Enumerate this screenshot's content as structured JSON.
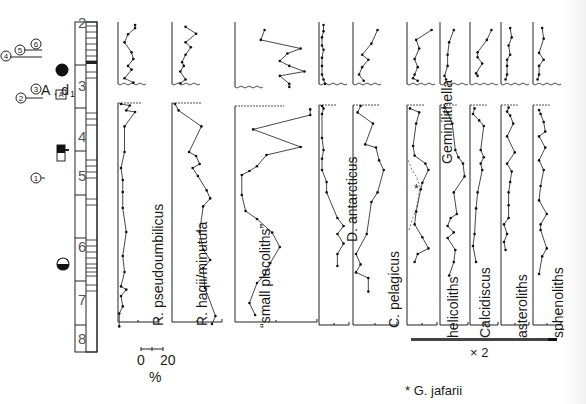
{
  "figure": {
    "scale_bar": {
      "left": "0",
      "right": "20",
      "unit": "%"
    },
    "magnification_bar": {
      "label": "× 2"
    },
    "footnote": "* G. jafarii"
  },
  "core_column": {
    "section_numbers": [
      "2",
      "3",
      "4",
      "5",
      "6",
      "7",
      "8"
    ],
    "left_markers": {
      "group_a": [
        "4",
        "5",
        "6"
      ],
      "group_b": [
        "2",
        "3"
      ],
      "circle_1": "1",
      "ad_label": "A . d",
      "ad_subscript": "1",
      "box_label": "A"
    }
  },
  "chart_data": {
    "type": "line",
    "title": "",
    "xlabel": "%",
    "ylabel": "Core section",
    "x_scale": "0–20 % per scale bar",
    "legend": [
      "* G. jafarii"
    ],
    "profiles": [
      {
        "name": "R. pseudoumbilicus",
        "upper": [
          [
            8,
            0
          ],
          [
            8,
            5
          ],
          [
            4,
            15
          ],
          [
            2,
            28
          ],
          [
            6,
            44
          ],
          [
            7,
            55
          ],
          [
            4,
            66
          ],
          [
            6,
            72
          ],
          [
            2,
            86
          ],
          [
            7,
            93
          ]
        ],
        "lower": [
          [
            0,
            0
          ],
          [
            5,
            2
          ],
          [
            3,
            8
          ],
          [
            8,
            10
          ],
          [
            2,
            28
          ],
          [
            2,
            60
          ],
          [
            0,
            80
          ],
          [
            1,
            95
          ],
          [
            1,
            110
          ],
          [
            1,
            130
          ],
          [
            3,
            160
          ],
          [
            1,
            190
          ],
          [
            2,
            210
          ],
          [
            0,
            228
          ],
          [
            3,
            232
          ],
          [
            0,
            240
          ],
          [
            1,
            253
          ],
          [
            -1,
            262
          ],
          [
            -1,
            278
          ]
        ]
      },
      {
        "name": "R. haqii/minutula",
        "upper": [
          [
            6,
            3
          ],
          [
            12,
            14
          ],
          [
            6,
            28
          ],
          [
            9,
            36
          ],
          [
            6,
            48
          ],
          [
            4,
            60
          ],
          [
            5,
            66
          ],
          [
            3,
            75
          ],
          [
            6,
            88
          ],
          [
            3,
            94
          ]
        ],
        "lower": [
          [
            0,
            0
          ],
          [
            2,
            8
          ],
          [
            15,
            28
          ],
          [
            8,
            60
          ],
          [
            12,
            65
          ],
          [
            14,
            75
          ],
          [
            10,
            80
          ],
          [
            13,
            90
          ],
          [
            18,
            108
          ],
          [
            20,
            118
          ],
          [
            16,
            128
          ],
          [
            14,
            160
          ],
          [
            16,
            182
          ],
          [
            20,
            195
          ],
          [
            16,
            205
          ],
          [
            17,
            230
          ],
          [
            23,
            265
          ],
          [
            21,
            275
          ]
        ]
      },
      {
        "name": "small placoliths",
        "upper": [
          [
            14,
            8
          ],
          [
            12,
            24
          ],
          [
            33,
            38
          ],
          [
            26,
            46
          ],
          [
            22,
            58
          ],
          [
            27,
            66
          ],
          [
            35,
            75
          ],
          [
            22,
            82
          ],
          [
            27,
            95
          ],
          [
            27,
            100
          ]
        ],
        "lower": [
          [
            38,
            3
          ],
          [
            38,
            10
          ],
          [
            8,
            28
          ],
          [
            33,
            50
          ],
          [
            15,
            60
          ],
          [
            10,
            74
          ],
          [
            6,
            80
          ],
          [
            2,
            85
          ],
          [
            2,
            110
          ],
          [
            4,
            130
          ],
          [
            10,
            140
          ],
          [
            18,
            157
          ],
          [
            22,
            175
          ],
          [
            17,
            195
          ],
          [
            14,
            210
          ],
          [
            10,
            220
          ],
          [
            6,
            245
          ],
          [
            9,
            260
          ]
        ]
      },
      {
        "name": "D. antarcticus",
        "upper": [
          [
            1,
            0
          ],
          [
            1,
            10
          ],
          [
            0,
            20
          ],
          [
            0,
            33
          ],
          [
            1,
            40
          ],
          [
            0,
            53
          ],
          [
            0,
            66
          ],
          [
            0,
            80
          ],
          [
            1,
            88
          ],
          [
            2,
            95
          ]
        ],
        "lower": [
          [
            0,
            0
          ],
          [
            1,
            3
          ],
          [
            0,
            10
          ],
          [
            0,
            40
          ],
          [
            1,
            55
          ],
          [
            0,
            66
          ],
          [
            0,
            80
          ],
          [
            3,
            95
          ],
          [
            3,
            108
          ],
          [
            10,
            140
          ],
          [
            14,
            150
          ],
          [
            10,
            160
          ],
          [
            14,
            172
          ],
          [
            10,
            185
          ],
          [
            10,
            200
          ]
        ]
      },
      {
        "name": "C. pelagicus",
        "upper": [
          [
            14,
            8
          ],
          [
            10,
            30
          ],
          [
            4,
            48
          ],
          [
            8,
            56
          ],
          [
            4,
            68
          ],
          [
            2,
            80
          ],
          [
            5,
            90
          ]
        ],
        "lower": [
          [
            3,
            0
          ],
          [
            1,
            8
          ],
          [
            11,
            22
          ],
          [
            6,
            48
          ],
          [
            13,
            52
          ],
          [
            15,
            68
          ],
          [
            18,
            80
          ],
          [
            14,
            108
          ],
          [
            10,
            120
          ],
          [
            7,
            160
          ],
          [
            0,
            185
          ],
          [
            3,
            198
          ],
          [
            0,
            208
          ],
          [
            8,
            215
          ],
          [
            8,
            232
          ]
        ]
      },
      {
        "name": "Geminilithella",
        "upper": [
          [
            14,
            8
          ],
          [
            4,
            24
          ],
          [
            6,
            38
          ],
          [
            3,
            55
          ],
          [
            5,
            68
          ],
          [
            3,
            80
          ],
          [
            2,
            86
          ],
          [
            5,
            90
          ]
        ],
        "lower": [
          [
            0,
            3
          ],
          [
            6,
            8
          ],
          [
            4,
            22
          ],
          [
            2,
            50
          ],
          [
            3,
            62
          ],
          [
            10,
            72
          ],
          [
            12,
            80
          ],
          [
            8,
            96
          ],
          [
            7,
            104
          ],
          [
            4,
            132
          ],
          [
            3,
            148
          ],
          [
            8,
            164
          ],
          [
            12,
            178
          ],
          [
            5,
            185
          ],
          [
            3,
            195
          ]
        ]
      },
      {
        "name": "helicoliths",
        "upper": [
          [
            7,
            8
          ],
          [
            4,
            28
          ],
          [
            3,
            48
          ],
          [
            3,
            66
          ],
          [
            1,
            82
          ],
          [
            2,
            88
          ]
        ],
        "lower": [
          [
            1,
            2
          ],
          [
            3,
            8
          ],
          [
            6,
            22
          ],
          [
            8,
            55
          ],
          [
            10,
            64
          ],
          [
            13,
            72
          ],
          [
            14,
            88
          ],
          [
            7,
            108
          ],
          [
            9,
            135
          ],
          [
            5,
            140
          ],
          [
            3,
            150
          ],
          [
            7,
            158
          ],
          [
            3,
            165
          ],
          [
            8,
            180
          ],
          [
            7,
            195
          ],
          [
            4,
            212
          ]
        ]
      },
      {
        "name": "Calcidiscus",
        "upper": [
          [
            12,
            8
          ],
          [
            9,
            24
          ],
          [
            3,
            44
          ],
          [
            3,
            52
          ],
          [
            6,
            62
          ],
          [
            2,
            78
          ],
          [
            3,
            82
          ]
        ],
        "lower": [
          [
            1,
            3
          ],
          [
            0,
            10
          ],
          [
            4,
            18
          ],
          [
            7,
            25
          ],
          [
            5,
            55
          ],
          [
            7,
            64
          ],
          [
            5,
            72
          ],
          [
            6,
            80
          ],
          [
            3,
            108
          ],
          [
            2,
            128
          ],
          [
            1,
            160
          ],
          [
            0,
            175
          ],
          [
            2,
            195
          ]
        ]
      },
      {
        "name": "asteroliths",
        "upper": [
          [
            4,
            5
          ],
          [
            5,
            20
          ],
          [
            3,
            33
          ],
          [
            4,
            48
          ],
          [
            2,
            56
          ],
          [
            2,
            66
          ],
          [
            2,
            80
          ],
          [
            1,
            88
          ]
        ],
        "lower": [
          [
            3,
            2
          ],
          [
            2,
            7
          ],
          [
            4,
            12
          ],
          [
            6,
            22
          ],
          [
            2,
            38
          ],
          [
            7,
            58
          ],
          [
            2,
            72
          ],
          [
            5,
            82
          ],
          [
            4,
            95
          ],
          [
            3,
            108
          ],
          [
            3,
            124
          ],
          [
            3,
            140
          ],
          [
            0,
            148
          ],
          [
            2,
            160
          ],
          [
            0,
            170
          ],
          [
            1,
            180
          ]
        ]
      },
      {
        "name": "sphenoliths",
        "upper": [
          [
            4,
            5
          ],
          [
            5,
            22
          ],
          [
            2,
            45
          ],
          [
            5,
            56
          ],
          [
            2,
            66
          ],
          [
            2,
            80
          ],
          [
            1,
            88
          ]
        ],
        "lower": [
          [
            2,
            5
          ],
          [
            3,
            10
          ],
          [
            5,
            20
          ],
          [
            6,
            32
          ],
          [
            2,
            38
          ],
          [
            6,
            52
          ],
          [
            2,
            68
          ],
          [
            5,
            80
          ],
          [
            3,
            100
          ],
          [
            2,
            118
          ],
          [
            7,
            135
          ],
          [
            3,
            148
          ],
          [
            3,
            155
          ],
          [
            7,
            178
          ],
          [
            4,
            188
          ],
          [
            2,
            210
          ]
        ]
      }
    ]
  }
}
